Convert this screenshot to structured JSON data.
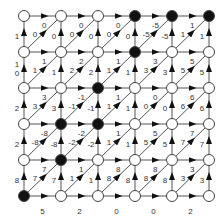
{
  "grid": {
    "cols_x": [
      24,
      61,
      98,
      135,
      172,
      209
    ],
    "rows_y": [
      16,
      52,
      88,
      124,
      160,
      196
    ],
    "black_nodes": [
      [
        0,
        3
      ],
      [
        0,
        4
      ],
      [
        0,
        5
      ],
      [
        1,
        3
      ],
      [
        2,
        2
      ],
      [
        3,
        1
      ],
      [
        3,
        2
      ],
      [
        4,
        1
      ],
      [
        5,
        0
      ]
    ]
  },
  "colors": {
    "line": "#555555",
    "arrow": "#111111",
    "node_fill_white": "#ffffff",
    "node_fill_black": "#111111",
    "label": "#333333"
  },
  "bands": [
    {
      "vertical": [
        "1",
        "0",
        "0",
        "0",
        "-5",
        "1"
      ],
      "top": [
        "0",
        "0",
        "0",
        "-5",
        "1"
      ],
      "diag": [
        "0",
        "0",
        "0",
        "-5",
        "1"
      ]
    },
    {
      "vertical": [
        "1\n0",
        "1",
        "2",
        "1",
        "3",
        "5"
      ],
      "top": [
        "1",
        "2",
        "1",
        "3",
        "5"
      ],
      "diag": [
        "1",
        "2",
        "1",
        "3",
        "5"
      ]
    },
    {
      "vertical": [
        "2",
        "3",
        "-1",
        "1",
        "0",
        "6"
      ],
      "top": [
        "3",
        "-1",
        "1",
        "0",
        "6"
      ],
      "diag": [
        "3",
        "-1",
        "1",
        "0",
        "6"
      ]
    },
    {
      "vertical": [
        "2",
        "-8",
        "-2",
        "1",
        "5",
        "7"
      ],
      "top": [
        "-8",
        "-2",
        "1",
        "5",
        "7"
      ],
      "diag": [
        "-8",
        "-2",
        "1",
        "5",
        "7"
      ]
    },
    {
      "vertical": [
        "8",
        "7",
        "1",
        "8",
        "8",
        "3"
      ],
      "top": [
        "7",
        "1",
        "8",
        "8",
        "3"
      ],
      "diag": [
        "7",
        "1",
        "8",
        "8",
        "3"
      ]
    }
  ],
  "bottom": [
    "5",
    "2",
    "0",
    "0",
    "2"
  ]
}
